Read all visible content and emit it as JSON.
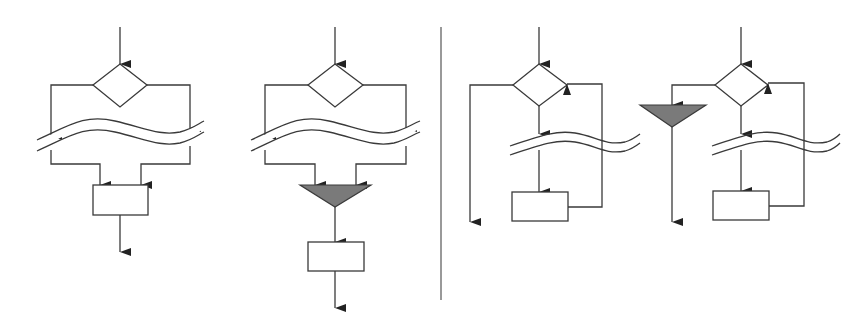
{
  "colors": {
    "line": "#3a3a3a",
    "background": "#ffffff",
    "merge_fill": "#7a7a7a"
  },
  "diagrams": [
    {
      "id": "parallel-branches-converge-on-box",
      "elements": [
        "entry-arrow",
        "decision-diamond",
        "left-branch",
        "right-branch",
        "break-symbol",
        "process-box",
        "exit-arrow"
      ]
    },
    {
      "id": "parallel-branches-merge-node",
      "elements": [
        "entry-arrow",
        "decision-diamond",
        "left-branch",
        "right-branch",
        "break-symbol",
        "merge-triangle",
        "process-box",
        "exit-arrow"
      ]
    },
    {
      "id": "loop-with-exit",
      "elements": [
        "entry-arrow",
        "decision-diamond",
        "exit-branch",
        "break-symbol",
        "process-box",
        "loop-back"
      ]
    },
    {
      "id": "loop-with-merge-exit",
      "elements": [
        "entry-arrow",
        "decision-diamond",
        "exit-branch",
        "merge-triangle",
        "break-symbol",
        "process-box",
        "loop-back"
      ]
    }
  ],
  "divider": {
    "orientation": "vertical"
  }
}
